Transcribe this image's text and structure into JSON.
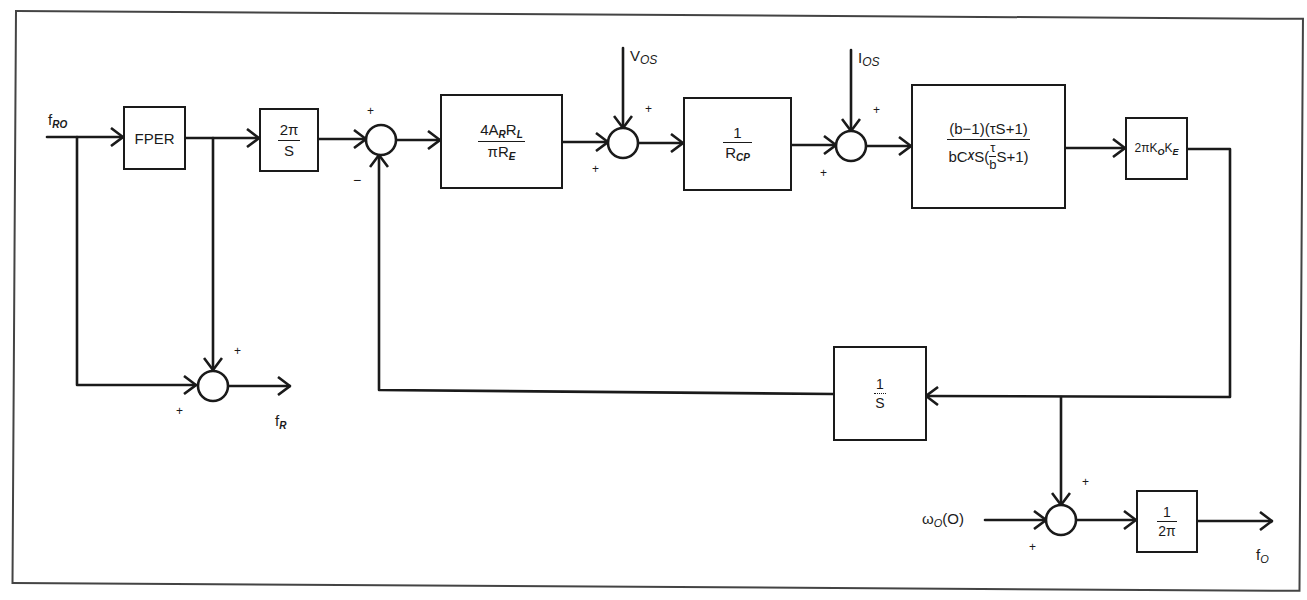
{
  "diagram": {
    "type": "control-system-block-diagram",
    "inputs": {
      "f_ro": {
        "main": "f",
        "sub": "RO"
      },
      "v_os": {
        "main": "V",
        "sub": "OS"
      },
      "i_os": {
        "main": "I",
        "sub": "OS"
      },
      "omega_o": {
        "main": "ω",
        "sub": "O",
        "tail": "(O)"
      }
    },
    "outputs": {
      "f_r": {
        "main": "f",
        "sub": "R"
      },
      "f_o": {
        "main": "f",
        "sub": "O"
      }
    },
    "blocks": {
      "fper": {
        "label": "FPER"
      },
      "two_pi_over_s": {
        "num": "2π",
        "den": "S"
      },
      "gain_ar_rl": {
        "num_a": "4A",
        "num_a_sub": "R",
        "num_b": "R",
        "num_b_sub": "L",
        "den": "πR",
        "den_sub": "E"
      },
      "inv_rcp": {
        "num": "1",
        "den": "R",
        "den_sub": "CP"
      },
      "filter": {
        "num": "(b−1)(τS+1)",
        "den_a": "bC",
        "den_a_sub": "X",
        "den_b": "S(",
        "den_frac_num": "τ",
        "den_frac_den": "b",
        "den_c": "S+1)"
      },
      "vco_gain": {
        "a": "2πK",
        "a_sub": "O",
        "b": "K",
        "b_sub": "E"
      },
      "integrator": {
        "num": "1",
        "den": "S"
      },
      "inv_two_pi": {
        "num": "1",
        "den": "2π"
      }
    },
    "summing_junctions": {
      "s_fr": {
        "signs": [
          "+",
          "+"
        ]
      },
      "s_main": {
        "signs": [
          "+",
          "−"
        ]
      },
      "s_vos": {
        "signs": [
          "+",
          "+"
        ]
      },
      "s_ios": {
        "signs": [
          "+",
          "+"
        ]
      },
      "s_out": {
        "signs": [
          "+",
          "+"
        ]
      }
    }
  }
}
